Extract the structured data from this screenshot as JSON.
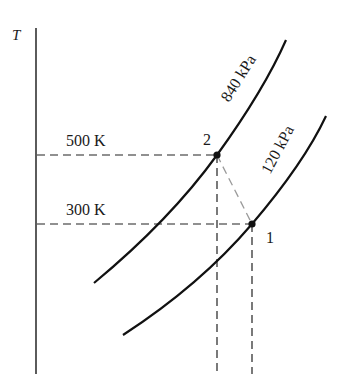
{
  "diagram": {
    "type": "T-s style process diagram",
    "axis": {
      "y_label": "T"
    },
    "isobars": [
      {
        "id": "high",
        "label": "840 kPa"
      },
      {
        "id": "low",
        "label": "120 kPa"
      }
    ],
    "temperatures": [
      {
        "id": "t2",
        "label": "500 K"
      },
      {
        "id": "t1",
        "label": "300 K"
      }
    ],
    "states": [
      {
        "id": "1",
        "label": "1"
      },
      {
        "id": "2",
        "label": "2"
      }
    ],
    "colors": {
      "line": "#111111",
      "dashed": "#222222",
      "process": "#9a9a9a"
    }
  }
}
